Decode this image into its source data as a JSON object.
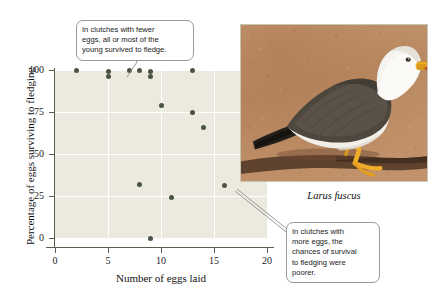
{
  "chart_data": {
    "type": "scatter",
    "title": "",
    "xlabel": "Number of eggs laid",
    "ylabel": "Percentage of eggs surviving to fledging",
    "xlim": [
      0,
      20
    ],
    "ylim": [
      0,
      100
    ],
    "xticks": [
      "0",
      "5",
      "10",
      "15",
      "20"
    ],
    "yticks": [
      "0",
      "25",
      "50",
      "75",
      "100"
    ],
    "grid": true,
    "legend": "none",
    "marker_color": "#4a5346",
    "plot_background": "#eceade",
    "series": [
      {
        "name": "clutches",
        "points": [
          {
            "x": 2,
            "y": 100
          },
          {
            "x": 5,
            "y": 99
          },
          {
            "x": 5,
            "y": 96
          },
          {
            "x": 7,
            "y": 100
          },
          {
            "x": 8,
            "y": 100
          },
          {
            "x": 9,
            "y": 99
          },
          {
            "x": 9,
            "y": 96
          },
          {
            "x": 10,
            "y": 79
          },
          {
            "x": 13,
            "y": 100
          },
          {
            "x": 13,
            "y": 75
          },
          {
            "x": 14,
            "y": 66
          },
          {
            "x": 8,
            "y": 32
          },
          {
            "x": 11,
            "y": 24
          },
          {
            "x": 16,
            "y": 31
          },
          {
            "x": 9,
            "y": 0
          }
        ]
      }
    ],
    "annotations": [
      {
        "id": "fewer",
        "text": "In clutches with fewer eggs, all or most of the young survived to fledge.",
        "points_to": {
          "x": 7,
          "y": 100
        }
      },
      {
        "id": "more",
        "text": "In clutches with more eggs, the chances of survival to fledging were poorer.",
        "points_to": {
          "x": 16,
          "y": 31
        }
      }
    ]
  },
  "annotations": {
    "fewer": {
      "line1": "In clutches with fewer",
      "line2": "eggs, all or most of the",
      "line3": "young survived to fledge."
    },
    "more": {
      "line1": "In clutches with",
      "line2": "more eggs, the",
      "line3": "chances of survival",
      "line4": "to fledging were",
      "line5": "poorer."
    }
  },
  "photo": {
    "caption": "Larus fuscus",
    "alt": "lesser-black-backed-gull-standing-on-sand",
    "colors": {
      "sand_light": "#c79a72",
      "sand_mid": "#b7835c",
      "sand_dark": "#9c6a47",
      "shadow": "#4a3426",
      "body_white": "#f4f2ee",
      "mantle_dark": "#4a443c",
      "wingtip_black": "#23211d",
      "bill_yellow": "#e8a party",
      "leg_yellow": "#efad2a"
    }
  }
}
